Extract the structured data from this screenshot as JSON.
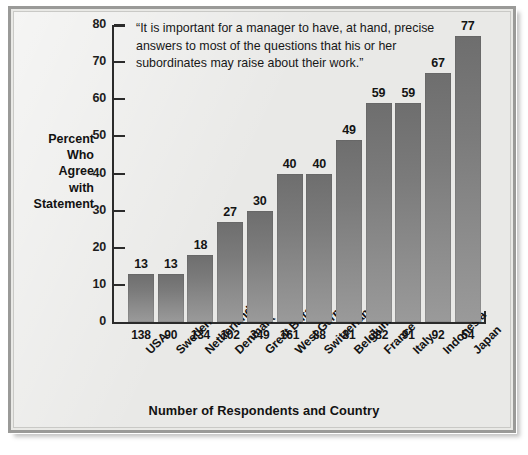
{
  "chart_data": {
    "type": "bar",
    "title": "",
    "quote": "“It is important for a manager to have, at hand, precise answers to most of the questions that his or her subordinates may raise about their work.”",
    "ylabel": "Percent Who Agree with Statement",
    "ylabel_lines": [
      "Percent",
      "Who",
      "Agree",
      "with",
      "Statement"
    ],
    "xlabel": "Number of Respondents and Country",
    "ylim": [
      0,
      80
    ],
    "ytick_step": 10,
    "yticks": [
      0,
      10,
      20,
      30,
      40,
      50,
      60,
      70,
      80
    ],
    "grid": false,
    "legend": "none",
    "categories": [
      "USA",
      "Sweden",
      "Netherlands",
      "Denmark",
      "Great Britain",
      "West Germany",
      "Switzerland",
      "Belgium",
      "France",
      "Italy",
      "Indonesia",
      "Japan"
    ],
    "respondents": [
      138,
      90,
      134,
      102,
      349,
      161,
      88,
      81,
      382,
      91,
      92,
      54
    ],
    "values": [
      13,
      13,
      18,
      27,
      30,
      40,
      40,
      49,
      59,
      59,
      67,
      77
    ],
    "bar_color": "#7f7f7f",
    "background_color": "#e9e9e7",
    "axis_color": "#2b2b2b"
  }
}
